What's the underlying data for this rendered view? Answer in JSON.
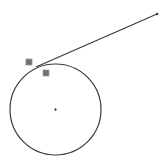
{
  "diagram": {
    "background": "#ffffff",
    "stroke_color": "#3a3a3a",
    "circle": {
      "cx": 55.5,
      "cy": 109.5,
      "r": 45.5
    },
    "center_marker": {
      "x": 55.5,
      "y": 109.5
    },
    "tangent_line": {
      "x1": 36,
      "y1": 67,
      "x2": 157,
      "y2": 14
    },
    "handles": [
      {
        "x": 29,
        "y": 62,
        "size": 6,
        "color": "#6f6f6f"
      },
      {
        "x": 46,
        "y": 73,
        "size": 6,
        "color": "#6f6f6f"
      }
    ]
  }
}
